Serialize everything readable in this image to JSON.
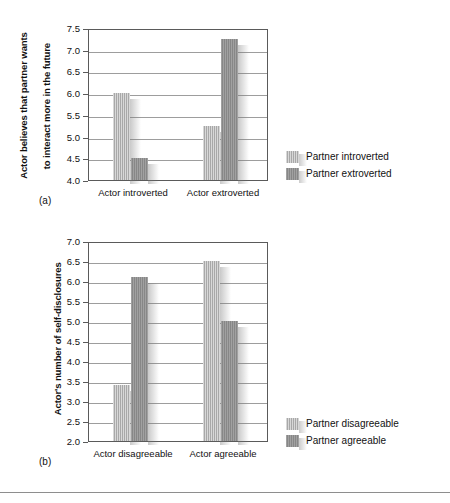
{
  "figure": {
    "background_color": "#ffffff",
    "bar_light_color": "#a8a8a8",
    "bar_dark_color": "#878787",
    "axis_color": "#5a5a5a",
    "grid_color": "#7d7d7d"
  },
  "panel_a": {
    "letter": "(a)",
    "ytitle_line1": "Actor believes that partner wants",
    "ytitle_line2": "to interact more in the future",
    "legend": [
      {
        "label": "Partner introverted",
        "swatch": "light"
      },
      {
        "label": "Partner extroverted",
        "swatch": "dark"
      }
    ]
  },
  "panel_b": {
    "letter": "(b)",
    "ytitle_line1": "Actor's number of self-disclosures",
    "legend": [
      {
        "label": "Partner disagreeable",
        "swatch": "light"
      },
      {
        "label": "Partner agreeable",
        "swatch": "dark"
      }
    ]
  },
  "chart_data": [
    {
      "type": "bar",
      "id": "panel-a",
      "title": "",
      "xlabel": "",
      "ylabel": "Actor believes that partner wants to interact more in the future",
      "ylim": [
        4.0,
        7.5
      ],
      "yticks": [
        4.0,
        4.5,
        5.0,
        5.5,
        6.0,
        6.5,
        7.0,
        7.5
      ],
      "ytick_labels": [
        "4.0",
        "4.5",
        "5.0",
        "5.5",
        "6.0",
        "6.5",
        "7.0",
        "7.5"
      ],
      "grid": true,
      "legend_position": "right",
      "categories": [
        "Actor introverted",
        "Actor extroverted"
      ],
      "series": [
        {
          "name": "Partner introverted",
          "values": [
            6.0,
            5.25
          ]
        },
        {
          "name": "Partner extroverted",
          "values": [
            4.5,
            7.25
          ]
        }
      ]
    },
    {
      "type": "bar",
      "id": "panel-b",
      "title": "",
      "xlabel": "",
      "ylabel": "Actor's number of self-disclosures",
      "ylim": [
        2.0,
        7.0
      ],
      "yticks": [
        2.0,
        2.5,
        3.0,
        3.5,
        4.0,
        4.5,
        5.0,
        5.5,
        6.0,
        6.5,
        7.0
      ],
      "ytick_labels": [
        "2.0",
        "2.5",
        "3.0",
        "3.5",
        "4.0",
        "4.5",
        "5.0",
        "5.5",
        "6.0",
        "6.5",
        "7.0"
      ],
      "grid": true,
      "legend_position": "right",
      "categories": [
        "Actor disagreeable",
        "Actor agreeable"
      ],
      "series": [
        {
          "name": "Partner disagreeable",
          "values": [
            3.4,
            6.5
          ]
        },
        {
          "name": "Partner agreeable",
          "values": [
            6.1,
            5.0
          ]
        }
      ]
    }
  ]
}
